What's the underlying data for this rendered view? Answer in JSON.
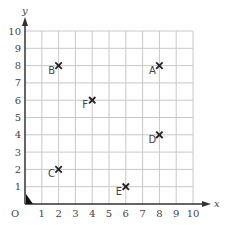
{
  "chart_data": {
    "type": "scatter",
    "title": "",
    "xlabel": "x",
    "ylabel": "y",
    "origin_label": "O",
    "xlim": [
      0,
      10
    ],
    "ylim": [
      0,
      10
    ],
    "grid": true,
    "x_ticks": [
      "1",
      "2",
      "3",
      "4",
      "5",
      "6",
      "7",
      "8",
      "9",
      "10"
    ],
    "y_ticks": [
      "1",
      "2",
      "3",
      "4",
      "5",
      "6",
      "7",
      "8",
      "9",
      "10"
    ],
    "marker": "x",
    "points": [
      {
        "label": "A",
        "x": 8,
        "y": 8
      },
      {
        "label": "B",
        "x": 2,
        "y": 8
      },
      {
        "label": "C",
        "x": 2,
        "y": 2
      },
      {
        "label": "D",
        "x": 8,
        "y": 4
      },
      {
        "label": "E",
        "x": 6,
        "y": 1
      },
      {
        "label": "F",
        "x": 4,
        "y": 6
      }
    ],
    "colors": {
      "grid": "#c8c8c8",
      "axis": "#333333",
      "marker": "#222222",
      "text": "#444444"
    }
  }
}
